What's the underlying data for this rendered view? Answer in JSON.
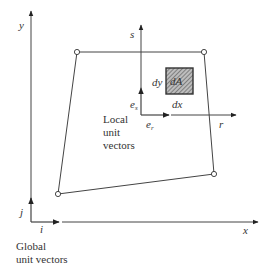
{
  "figure": {
    "global_axes": {
      "x_label": "x",
      "y_label": "y"
    },
    "global_unit_vectors": {
      "i_label": "i",
      "j_label": "j",
      "caption_line1": "Global",
      "caption_line2": "unit vectors"
    },
    "local_axes": {
      "r_label": "r",
      "s_label": "s"
    },
    "local_unit_vectors": {
      "er_label": "e",
      "er_sub": "r",
      "es_label": "e",
      "es_sub": "s",
      "caption_line1": "Local",
      "caption_line2": "unit",
      "caption_line3": "vectors"
    },
    "area_element": {
      "label": "dA",
      "dx_label": "dx",
      "dy_label": "dy"
    },
    "element_nodes": 4,
    "colors": {
      "line": "#444444",
      "text": "#333333",
      "hatch": "#777777"
    }
  }
}
